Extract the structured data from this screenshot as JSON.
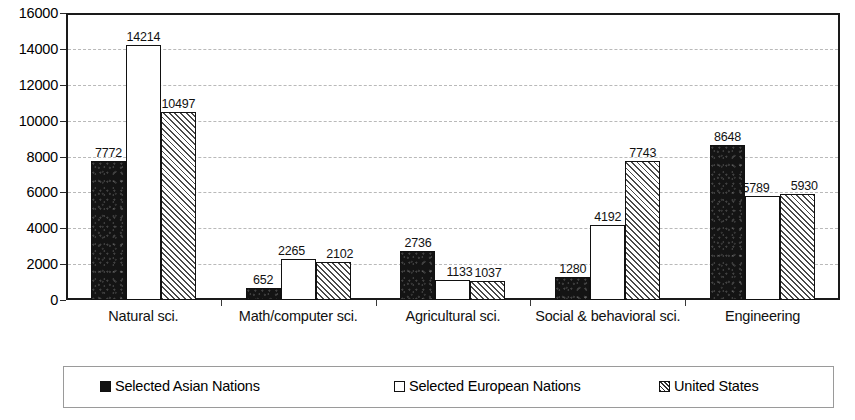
{
  "chart_data": {
    "type": "bar",
    "title": "",
    "xlabel": "",
    "ylabel": "",
    "ylim": [
      0,
      16000
    ],
    "ytick_step": 2000,
    "yticks": [
      0,
      2000,
      4000,
      6000,
      8000,
      10000,
      12000,
      14000,
      16000
    ],
    "ytick_labels": [
      "0",
      "2000",
      "4000",
      "6000",
      "8000",
      "10000",
      "12000",
      "14000",
      "16000"
    ],
    "grid": true,
    "legend_position": "bottom",
    "categories": [
      "Natural sci.",
      "Math/computer sci.",
      "Agricultural sci.",
      "Social & behavioral sci.",
      "Engineering"
    ],
    "series": [
      {
        "name": "Selected Asian Nations",
        "fill": "solid-black",
        "values": [
          7772,
          652,
          2736,
          1280,
          8648
        ]
      },
      {
        "name": "Selected European Nations",
        "fill": "hollow-white",
        "values": [
          14214,
          2265,
          1133,
          4192,
          5789
        ]
      },
      {
        "name": "United States",
        "fill": "diagonal-hatch",
        "values": [
          10497,
          2102,
          1037,
          7743,
          5930
        ]
      }
    ]
  },
  "colors": {
    "axis": "#1a1a1a",
    "gridline": "#b9b9b9",
    "series_asian": "#141414",
    "series_european": "#ffffff",
    "series_us": "#4a4a4a",
    "text": "#111111",
    "legend_border": "#9a9a9a"
  }
}
